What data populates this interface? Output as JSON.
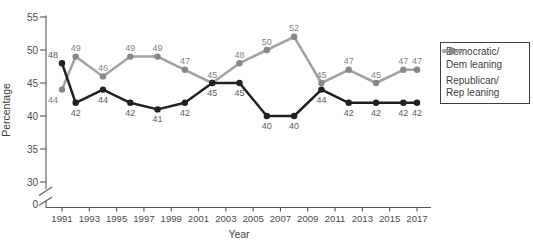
{
  "chart_data": {
    "type": "line",
    "x": [
      1991,
      1992,
      1994,
      1996,
      1998,
      2000,
      2002,
      2004,
      2006,
      2008,
      2010,
      2012,
      2014,
      2016,
      2017
    ],
    "x_ticks": [
      "1991",
      "1993",
      "1995",
      "1997",
      "1999",
      "2001",
      "2003",
      "2005",
      "2007",
      "2009",
      "2011",
      "2013",
      "2015",
      "2017"
    ],
    "y_ticks": [
      "55",
      "50",
      "45",
      "40",
      "35",
      "30",
      "0"
    ],
    "ylim": [
      30,
      55
    ],
    "y_axis_break": true,
    "grid": "off",
    "xlabel": "Year",
    "ylabel": "Percentage",
    "legend_position": "right",
    "axis_color": "#57585b",
    "tick_label_color": "#4b4c4e",
    "series": [
      {
        "name": "Democratic/Dem leaning",
        "legend_lines": [
          "Democratic/",
          "Dem leaning"
        ],
        "color": "#231f20",
        "marker_color": "#231f20",
        "label_color": "#5a5b5e",
        "values": [
          48,
          42,
          44,
          42,
          41,
          42,
          45,
          45,
          40,
          40,
          44,
          42,
          42,
          42,
          42
        ]
      },
      {
        "name": "Republican/Rep leaning",
        "legend_lines": [
          "Republican/",
          "Rep leaning"
        ],
        "color": "#a0a2a5",
        "marker_color": "#86888b",
        "label_color": "#828385",
        "values": [
          44,
          49,
          46,
          49,
          49,
          47,
          45,
          48,
          50,
          52,
          45,
          47,
          45,
          47,
          47
        ]
      }
    ]
  }
}
